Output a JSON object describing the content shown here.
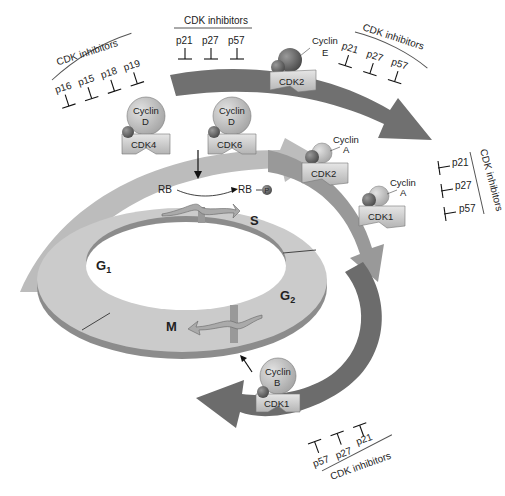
{
  "diagram": {
    "phases": {
      "g1": "G",
      "g1_sub": "1",
      "s": "S",
      "g2": "G",
      "g2_sub": "2",
      "m": "M"
    },
    "rb": {
      "left": "RB",
      "right": "RB",
      "phospho": "P"
    },
    "complexes": [
      {
        "cdk": "CDK4",
        "cyclin_l1": "Cyclin",
        "cyclin_l2": "D"
      },
      {
        "cdk": "CDK6",
        "cyclin_l1": "Cyclin",
        "cyclin_l2": "D"
      },
      {
        "cdk": "CDK2",
        "cyclin_l1": "Cyclin",
        "cyclin_l2": "E"
      },
      {
        "cdk": "CDK2",
        "cyclin_l1": "Cyclin",
        "cyclin_l2": "A"
      },
      {
        "cdk": "CDK1",
        "cyclin_l1": "Cyclin",
        "cyclin_l2": "A"
      },
      {
        "cdk": "CDK1",
        "cyclin_l1": "Cyclin",
        "cyclin_l2": "B"
      }
    ],
    "inhibitor_groups": [
      {
        "title": "CDK inhibitors",
        "items": [
          "p16",
          "p15",
          "p18",
          "p19"
        ]
      },
      {
        "title": "CDK inhibitors",
        "items": [
          "p21",
          "p27",
          "p57"
        ]
      },
      {
        "title": "CDK inhibitors",
        "items": [
          "p21",
          "p27",
          "p57"
        ]
      },
      {
        "title": "CDK inhibitors",
        "items": [
          "p21",
          "p27",
          "p57"
        ]
      },
      {
        "title": "CDK inhibitors",
        "items": [
          "p57",
          "p27",
          "p21"
        ]
      }
    ],
    "colors": {
      "arrow_light": "#b9b9b9",
      "arrow_mid": "#9a9a9a",
      "arrow_dark": "#6e6e6e",
      "ring_top": "#c8c8c8",
      "ring_side": "#8a8a8a",
      "cdk_body": "#d4d4d4",
      "cyclin": "#bdbdbd",
      "small_sphere": "#6a6a6a"
    }
  }
}
